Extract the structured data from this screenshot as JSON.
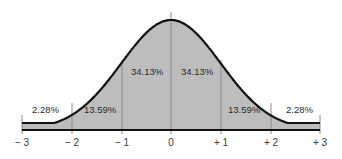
{
  "chart_data": {
    "type": "area",
    "title": "",
    "xlabel": "",
    "ylabel": "",
    "x_ticks": [
      "− 3",
      "− 2",
      "− 1",
      "0",
      "+ 1",
      "+ 2",
      "+ 3"
    ],
    "x_values": [
      -3,
      -2,
      -1,
      0,
      1,
      2,
      3
    ],
    "xlim": [
      -3,
      3
    ],
    "grid": false,
    "legend": "none",
    "series": [
      {
        "name": "Normal distribution",
        "curve": "standard normal density"
      }
    ],
    "regions": [
      {
        "range": "< -2",
        "label": "2.28%",
        "value": 2.28
      },
      {
        "range": "-2 to -1",
        "label": "13.59%",
        "value": 13.59
      },
      {
        "range": "-1 to 0",
        "label": "34.13%",
        "value": 34.13
      },
      {
        "range": "0 to +1",
        "label": "34.13%",
        "value": 34.13
      },
      {
        "range": "+1 to +2",
        "label": "13.59%",
        "value": 13.59
      },
      {
        "range": "> +2",
        "label": "2.28%",
        "value": 2.28
      }
    ],
    "colors": {
      "fill": "#bdbdbd",
      "curve": "#111111",
      "dividers": "#8a8a8a"
    }
  }
}
